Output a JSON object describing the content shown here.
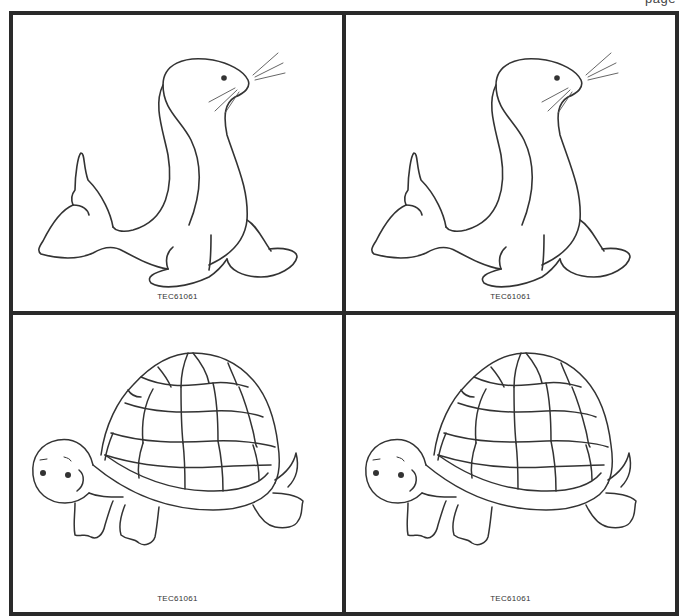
{
  "page": {
    "header_label": "page"
  },
  "cells": [
    {
      "animal": "sea lion",
      "code": "TEC61061"
    },
    {
      "animal": "sea lion",
      "code": "TEC61061"
    },
    {
      "animal": "turtle",
      "code": "TEC61061"
    },
    {
      "animal": "turtle",
      "code": "TEC61061"
    }
  ],
  "colors": {
    "border": "#2a2a2a",
    "line": "#333333",
    "background": "#ffffff"
  }
}
